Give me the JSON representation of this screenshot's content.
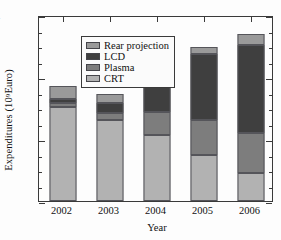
{
  "chart_data": {
    "type": "bar",
    "stacked": true,
    "title": "",
    "xlabel": "Year",
    "ylabel": "Expenditures (10⁹ Euro)",
    "ylabel_base": "Expenditures (10",
    "ylabel_exponent": "9",
    "ylabel_tail": " Euro)",
    "categories": [
      "2002",
      "2003",
      "2004",
      "2005",
      "2006"
    ],
    "ylim": [
      0,
      24
    ],
    "yticks": [
      0,
      8,
      16,
      24
    ],
    "ytick_labels": [
      "0",
      "8",
      "16",
      "24"
    ],
    "yminorticks": [
      2,
      4,
      6,
      10,
      12,
      14,
      18,
      20,
      22
    ],
    "grid": false,
    "legend_position": "upper left",
    "stack_order_bottom_to_top": [
      "CRT",
      "Plasma",
      "LCD",
      "Rear projection"
    ],
    "series": [
      {
        "name": "CRT",
        "color": "#b2b2b2",
        "values": [
          12.1,
          10.4,
          8.5,
          5.9,
          3.6
        ]
      },
      {
        "name": "Plasma",
        "color": "#7d7d7d",
        "values": [
          0.6,
          0.9,
          3.0,
          4.5,
          5.2
        ]
      },
      {
        "name": "LCD",
        "color": "#3f3f3f",
        "values": [
          0.5,
          1.4,
          3.8,
          8.6,
          11.3
        ]
      },
      {
        "name": "Rear projection",
        "color": "#9a9a9a",
        "values": [
          1.6,
          1.1,
          1.7,
          0.9,
          1.4
        ]
      }
    ],
    "totals": [
      14.8,
      13.8,
      17.0,
      19.9,
      21.5
    ]
  },
  "legend": {
    "items": [
      {
        "label": "Rear projection",
        "color": "#9a9a9a"
      },
      {
        "label": "LCD",
        "color": "#3f3f3f"
      },
      {
        "label": "Plasma",
        "color": "#7d7d7d"
      },
      {
        "label": "CRT",
        "color": "#b2b2b2"
      }
    ]
  },
  "style": {
    "axis_color": "#3a3a3a",
    "background": "#fdfdfd",
    "bar_edge": "#55555a"
  }
}
